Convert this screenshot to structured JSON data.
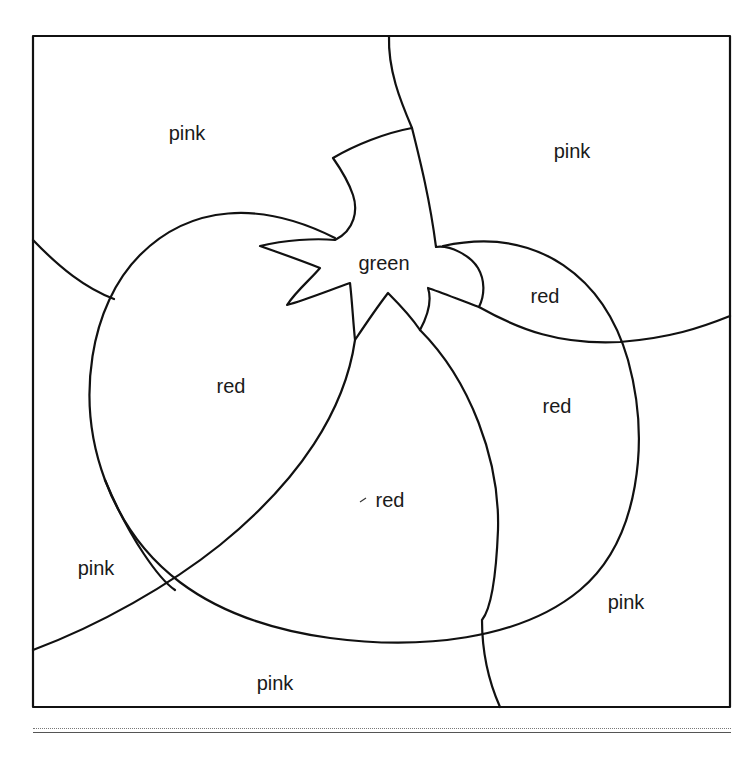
{
  "worksheet": {
    "type": "color-by-word coloring page",
    "subject": "tomato",
    "regions": [
      {
        "id": "pink_top_left",
        "label": "pink"
      },
      {
        "id": "pink_top_right",
        "label": "pink"
      },
      {
        "id": "green_stem",
        "label": "green"
      },
      {
        "id": "red_top_right",
        "label": "red"
      },
      {
        "id": "red_left",
        "label": "red"
      },
      {
        "id": "red_right",
        "label": "red"
      },
      {
        "id": "red_center",
        "label": "red"
      },
      {
        "id": "pink_bottom_left",
        "label": "pink"
      },
      {
        "id": "pink_bottom_right",
        "label": "pink"
      },
      {
        "id": "pink_bottom",
        "label": "pink"
      }
    ]
  },
  "colors": {
    "line": "#111111",
    "background": "#ffffff"
  }
}
